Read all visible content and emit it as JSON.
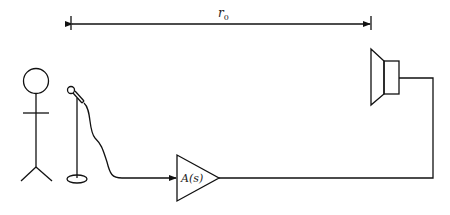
{
  "diagram": {
    "distance_label": "r",
    "distance_subscript": "0",
    "amplifier_label": "A(s)",
    "components": [
      {
        "id": "person",
        "type": "stick-figure"
      },
      {
        "id": "microphone",
        "type": "microphone-on-stand"
      },
      {
        "id": "amplifier",
        "type": "triangle-amplifier",
        "label": "A(s)"
      },
      {
        "id": "loudspeaker",
        "type": "speaker"
      }
    ],
    "connections": [
      {
        "from": "microphone",
        "to": "amplifier",
        "arrow": true
      },
      {
        "from": "amplifier",
        "to": "loudspeaker",
        "arrow": false
      }
    ],
    "dimension": {
      "from": "microphone",
      "to": "loudspeaker",
      "label": "r0"
    }
  }
}
